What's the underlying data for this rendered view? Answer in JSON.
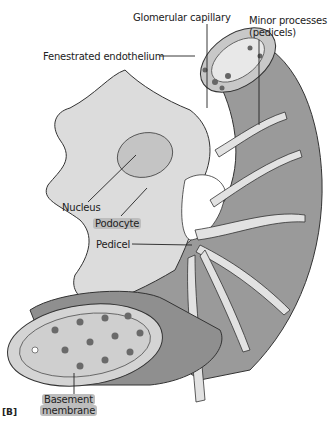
{
  "figure": {
    "panel_label": "[B]",
    "labels": {
      "glomerular_capillary": "Glomerular capillary",
      "minor_processes_line1": "Minor processes",
      "minor_processes_line2": "(pedicels)",
      "fenestrated_endothelium": "Fenestrated endothelium",
      "nucleus": "Nucleus",
      "podocyte": "Podocyte",
      "pedicel": "Pedicel",
      "basement_membrane_line1": "Basement",
      "basement_membrane_line2": "membrane"
    },
    "colors": {
      "capillary_dark": "#8a8a8a",
      "capillary_mid": "#a9a9a9",
      "podocyte_fill": "#dcdcdc",
      "highlight": "#bdbdbd",
      "outline": "#333333"
    }
  }
}
